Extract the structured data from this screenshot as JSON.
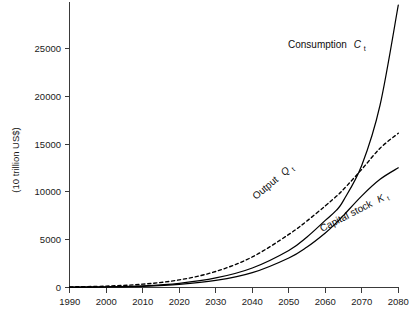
{
  "chart_data": {
    "type": "line",
    "title": "",
    "subtitle": "",
    "xlabel": "",
    "ylabel": "(10 trillion US$)",
    "xlim": [
      1990,
      2080
    ],
    "ylim": [
      0,
      28500
    ],
    "grid": false,
    "legend_position": "inline-curve-labels",
    "x_ticks": [
      "1990",
      "2000",
      "2010",
      "2020",
      "2030",
      "2040",
      "2050",
      "2060",
      "2070",
      "2080"
    ],
    "x_tick_values": [
      1990,
      2000,
      2010,
      2020,
      2030,
      2040,
      2050,
      2060,
      2070,
      2080
    ],
    "y_ticks": [
      "0",
      "5000",
      "10000",
      "15000",
      "20000",
      "25000"
    ],
    "y_tick_values": [
      0,
      5000,
      10000,
      15000,
      20000,
      25000
    ],
    "x": [
      1990,
      2000,
      2010,
      2020,
      2030,
      2040,
      2050,
      2055,
      2060,
      2063,
      2065,
      2070,
      2075,
      2080
    ],
    "series": [
      {
        "name": "Consumption",
        "symbol": "C",
        "subscript": "t",
        "label": "Consumption C",
        "style": "solid",
        "color": "#000000",
        "values": [
          30,
          70,
          170,
          420,
          950,
          1950,
          3700,
          5050,
          6700,
          7700,
          8700,
          12200,
          18200,
          28200
        ]
      },
      {
        "name": "Output",
        "symbol": "Q",
        "subscript": "t",
        "label": "Output Q",
        "style": "dashed",
        "color": "#000000",
        "values": [
          60,
          140,
          330,
          760,
          1600,
          3050,
          5300,
          6650,
          8150,
          9100,
          9800,
          11800,
          13900,
          15400
        ]
      },
      {
        "name": "Capital stock",
        "symbol": "K",
        "subscript": "t",
        "label": "Capital stock K",
        "style": "solid",
        "color": "#000000",
        "values": [
          20,
          50,
          120,
          300,
          700,
          1480,
          2950,
          4050,
          5450,
          6450,
          7200,
          9150,
          10800,
          11950
        ]
      }
    ],
    "annotations": [
      {
        "name": "consumption-label",
        "text": "Consumption",
        "symbol": "C",
        "subscript": "t",
        "rotation": 0
      },
      {
        "name": "output-label",
        "text": "Output",
        "symbol": "Q",
        "subscript": "t",
        "rotation": -40
      },
      {
        "name": "capital-label",
        "text": "Capital stock",
        "symbol": "K",
        "subscript": "t",
        "rotation": -27
      }
    ]
  },
  "axes": {
    "y_axis_title": "(10 trillion US$)",
    "x_axis_title": ""
  }
}
